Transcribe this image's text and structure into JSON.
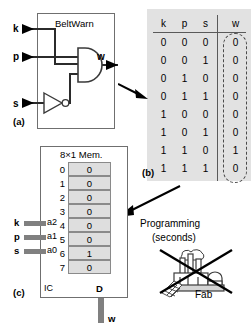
{
  "figure": {
    "panel_a": {
      "label": "(a)",
      "title": "BeltWarn",
      "inputs": [
        "k",
        "p",
        "s"
      ],
      "output": "w",
      "gates": [
        "and-gate",
        "inverter"
      ]
    },
    "panel_b": {
      "label": "(b)",
      "table": {
        "type": "table",
        "headers": [
          "k",
          "p",
          "s",
          "w"
        ],
        "rows": [
          [
            "0",
            "0",
            "0",
            "0"
          ],
          [
            "0",
            "0",
            "1",
            "0"
          ],
          [
            "0",
            "1",
            "0",
            "0"
          ],
          [
            "0",
            "1",
            "1",
            "0"
          ],
          [
            "1",
            "0",
            "0",
            "0"
          ],
          [
            "1",
            "0",
            "1",
            "0"
          ],
          [
            "1",
            "1",
            "0",
            "1"
          ],
          [
            "1",
            "1",
            "1",
            "0"
          ]
        ],
        "highlighted_column": "w"
      }
    },
    "panel_c": {
      "label": "(c)",
      "title": "8×1 Mem.",
      "ic_label": "IC",
      "data_pin_label": "D",
      "output_label": "w",
      "address_lines": [
        {
          "signal": "k",
          "pin": "a2"
        },
        {
          "signal": "p",
          "pin": "a1"
        },
        {
          "signal": "s",
          "pin": "a0"
        }
      ],
      "memory": [
        {
          "index": "0",
          "value": "0"
        },
        {
          "index": "1",
          "value": "0"
        },
        {
          "index": "2",
          "value": "0"
        },
        {
          "index": "3",
          "value": "0"
        },
        {
          "index": "4",
          "value": "0"
        },
        {
          "index": "5",
          "value": "0"
        },
        {
          "index": "6",
          "value": "1"
        },
        {
          "index": "7",
          "value": "0"
        }
      ]
    },
    "annotations": {
      "programming_line1": "Programming",
      "programming_line2": "(seconds)",
      "fab_label": "Fab"
    },
    "colors": {
      "panel_bg": "#e2e2e2",
      "cell_fill": "#dedede",
      "line": "#4a4a4a",
      "bus": "#808080"
    }
  }
}
